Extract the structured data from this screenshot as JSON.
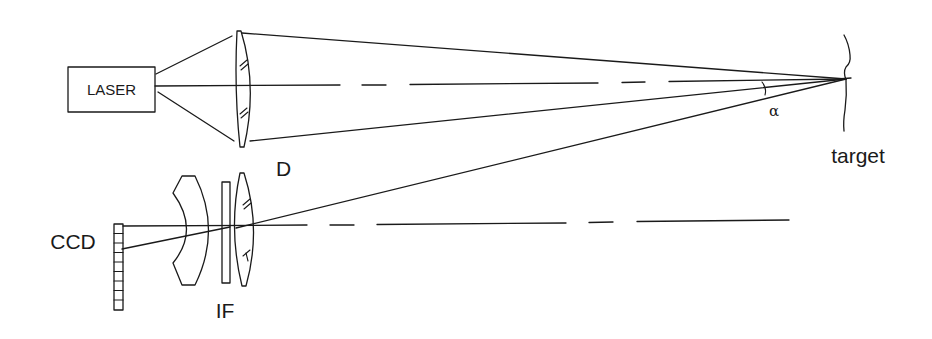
{
  "diagram": {
    "type": "optical-triangulation-schematic",
    "labels": {
      "laser": "LASER",
      "lens_d": "D",
      "target": "target",
      "angle": "α",
      "ccd": "CCD",
      "filter": "IF"
    },
    "components": [
      {
        "id": "laser",
        "label": "LASER",
        "kind": "light-source-box"
      },
      {
        "id": "lens_d",
        "label": "D",
        "kind": "collimating-lens"
      },
      {
        "id": "target",
        "label": "target",
        "kind": "target-surface"
      },
      {
        "id": "meniscus",
        "label": "",
        "kind": "meniscus-lens"
      },
      {
        "id": "filter",
        "label": "IF",
        "kind": "interference-filter-plate"
      },
      {
        "id": "lens_rx",
        "label": "",
        "kind": "receiving-lens"
      },
      {
        "id": "ccd",
        "label": "CCD",
        "kind": "linear-detector-array",
        "cells": 9
      }
    ],
    "angle_label": "α",
    "colors": {
      "line": "#1a1a1a",
      "background": "#ffffff"
    }
  }
}
